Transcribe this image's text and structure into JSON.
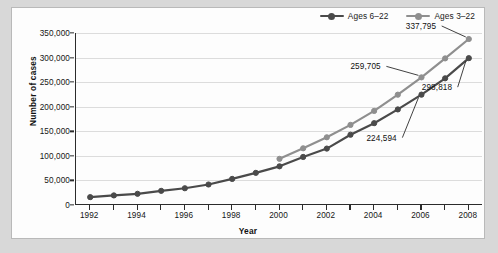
{
  "chart_data": {
    "type": "line",
    "title": "",
    "xlabel": "Year",
    "ylabel": "Number of cases",
    "x": [
      1992,
      1993,
      1994,
      1995,
      1996,
      1997,
      1998,
      1999,
      2000,
      2001,
      2002,
      2003,
      2004,
      2005,
      2006,
      2007,
      2008
    ],
    "xlim": [
      1991.4,
      2008.6
    ],
    "ylim": [
      0,
      350000
    ],
    "xtick_labels": [
      "1992",
      "1994",
      "1996",
      "1998",
      "2000",
      "2002",
      "2004",
      "2006",
      "2008"
    ],
    "xtick_values": [
      1992,
      1994,
      1996,
      1998,
      2000,
      2002,
      2004,
      2006,
      2008
    ],
    "xtick_minor_values": [
      1993,
      1995,
      1997,
      1999,
      2001,
      2003,
      2005,
      2007
    ],
    "ytick_labels": [
      "0",
      "50,000",
      "100,000",
      "150,000",
      "200,000",
      "250,000",
      "300,000",
      "350,000"
    ],
    "ytick_values": [
      0,
      50000,
      100000,
      150000,
      200000,
      250000,
      300000,
      350000
    ],
    "grid": "horizontal",
    "legend_position": "top-right",
    "series": [
      {
        "name": "Ages 6–22",
        "color": "#4a4a4a",
        "x": [
          1992,
          1993,
          1994,
          1995,
          1996,
          1997,
          1998,
          1999,
          2000,
          2001,
          2002,
          2003,
          2004,
          2005,
          2006,
          2007,
          2008
        ],
        "values": [
          16000,
          19500,
          22800,
          28800,
          34100,
          41700,
          53100,
          65400,
          78700,
          97800,
          114800,
          143000,
          166500,
          194500,
          224594,
          257800,
          298818
        ]
      },
      {
        "name": "Ages 3–22",
        "color": "#8f8f8f",
        "x": [
          2000,
          2001,
          2002,
          2003,
          2004,
          2005,
          2006,
          2007,
          2008
        ],
        "values": [
          93900,
          115400,
          137800,
          163000,
          191500,
          224500,
          259705,
          298300,
          337795
        ]
      }
    ],
    "annotations": [
      {
        "text": "337,795",
        "series": "Ages 3–22",
        "year": 2008,
        "value": 337795
      },
      {
        "text": "259,705",
        "series": "Ages 3–22",
        "year": 2006,
        "value": 259705
      },
      {
        "text": "298,818",
        "series": "Ages 6–22",
        "year": 2008,
        "value": 298818
      },
      {
        "text": "224,594",
        "series": "Ages 6–22",
        "year": 2006,
        "value": 224594
      }
    ]
  },
  "legend": {
    "items": [
      {
        "label": "Ages 6–22",
        "color": "#4a4a4a"
      },
      {
        "label": "Ages 3–22",
        "color": "#8f8f8f"
      }
    ]
  },
  "axes": {
    "x_title": "Year",
    "y_title": "Number of cases"
  },
  "colors": {
    "series_dark": "#4a4a4a",
    "series_gray": "#8f8f8f",
    "axis": "#2b2b2b",
    "grid": "#dcdcdc",
    "page_background": "#d8d8d8",
    "figure_background": "#fdfdfd"
  }
}
